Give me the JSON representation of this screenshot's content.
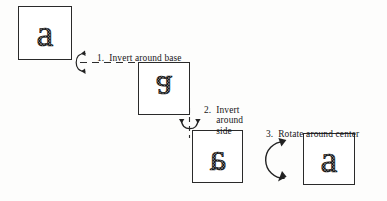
{
  "figure": {
    "background_color": "#fdfdfc",
    "ink_color": "#1a1a1a"
  },
  "boxes": [
    {
      "id": "box-start",
      "letter": "a",
      "orientation": "upright",
      "description": "lowercase a, upright"
    },
    {
      "id": "box-inverted",
      "letter": "g",
      "orientation": "flipped-vertically",
      "description": "lowercase a inverted around base, reads as g"
    },
    {
      "id": "box-mirrored",
      "letter": "e",
      "orientation": "flipped-horizontally",
      "description": "letter inverted around side, mirrored form"
    },
    {
      "id": "box-end",
      "letter": "a",
      "orientation": "upright",
      "description": "lowercase a restored after rotation"
    }
  ],
  "steps": [
    {
      "number": "1.",
      "text": "Invert around base",
      "lines": [
        "Invert around base"
      ],
      "icon": "flip-vertical-arrow-icon"
    },
    {
      "number": "2.",
      "text": "Invert around side",
      "lines": [
        "Invert",
        "around",
        "side"
      ],
      "icon": "flip-horizontal-arrow-icon"
    },
    {
      "number": "3.",
      "text": "Rotate around center",
      "lines": [
        "Rotate around center"
      ],
      "icon": "circular-rotation-arrow-icon"
    }
  ]
}
